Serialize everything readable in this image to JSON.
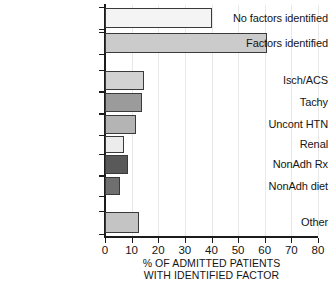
{
  "chart_data": {
    "type": "bar",
    "orientation": "horizontal",
    "title": "",
    "xlabel": "% OF ADMITTED PATIENTS WITH IDENTIFIED FACTOR",
    "xlabel_lines": [
      "% OF ADMITTED PATIENTS",
      "WITH IDENTIFIED FACTOR"
    ],
    "ylabel": "",
    "xlim": [
      0,
      80
    ],
    "xticks": [
      0,
      10,
      20,
      30,
      40,
      50,
      60,
      70,
      80
    ],
    "xtick_labels": [
      "0",
      "10",
      "20",
      "30",
      "40",
      "50",
      "60",
      "70",
      "80"
    ],
    "grid": true,
    "grid_axis": "x",
    "legend": "none",
    "categories": [
      "No factors identified",
      "Factors identified",
      "Isch/ACS",
      "Tachy",
      "Uncont HTN",
      "Renal",
      "NonAdh Rx",
      "NonAdh diet",
      "Other"
    ],
    "values": [
      40,
      61,
      14.5,
      14,
      11.5,
      7,
      8.5,
      5.5,
      12.8
    ],
    "bar_colors": [
      "#f4f4f4",
      "#cbcbcb",
      "#d2d2d2",
      "#9b9b9b",
      "#b4b4b4",
      "#ececec",
      "#595959",
      "#6f6f6f",
      "#c4c4c4"
    ],
    "bar_edge_color": "#3a3a3a",
    "bars": [
      {
        "label": "No factors identified",
        "value": 40,
        "color": "#f4f4f4",
        "top": 8,
        "height": 20,
        "group": "summary"
      },
      {
        "label": "Factors identified",
        "value": 61,
        "color": "#cbcbcb",
        "top": 33,
        "height": 20,
        "group": "summary"
      },
      {
        "label": "Isch/ACS",
        "value": 14.5,
        "color": "#d2d2d2",
        "top": 71,
        "height": 19,
        "group": "factor"
      },
      {
        "label": "Tachy",
        "value": 14,
        "color": "#9b9b9b",
        "top": 93,
        "height": 19,
        "group": "factor"
      },
      {
        "label": "Uncont HTN",
        "value": 11.5,
        "color": "#b4b4b4",
        "top": 115,
        "height": 19,
        "group": "factor"
      },
      {
        "label": "Renal",
        "value": 7,
        "color": "#ececec",
        "top": 136,
        "height": 17,
        "group": "factor"
      },
      {
        "label": "NonAdh Rx",
        "value": 8.5,
        "color": "#595959",
        "top": 155,
        "height": 19,
        "group": "factor"
      },
      {
        "label": "NonAdh diet",
        "value": 5.5,
        "color": "#6f6f6f",
        "top": 177,
        "height": 18,
        "group": "factor"
      },
      {
        "label": "Other",
        "value": 12.8,
        "color": "#c4c4c4",
        "top": 212,
        "height": 21,
        "group": "other"
      }
    ]
  }
}
